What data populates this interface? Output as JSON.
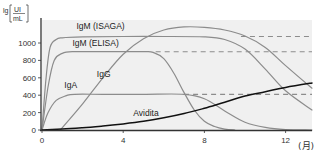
{
  "chart_data": {
    "type": "line",
    "title": "",
    "xlabel": "(月)",
    "ylabel": "lg [UI/mL]",
    "ylabel_parts": {
      "prefix": "lg",
      "numerator": "UI",
      "denominator": "mL"
    },
    "xlim": [
      0,
      13.3
    ],
    "ylim": [
      0,
      1250
    ],
    "x_ticks": [
      0,
      4,
      8,
      12
    ],
    "x_tick_labels": [
      "0",
      "4",
      "8",
      "12"
    ],
    "y_ticks": [
      0,
      200,
      400,
      600,
      800,
      1000
    ],
    "y_tick_labels": [
      "0",
      "200",
      "400",
      "600",
      "800",
      "1000"
    ],
    "grid": false,
    "legend": "inline labels",
    "series": [
      {
        "name": "IgM (ISAGA)",
        "color": "#8c8c8c",
        "x": [
          0,
          0.2,
          0.4,
          0.7,
          1.0,
          2,
          4,
          6,
          8,
          9,
          10,
          11,
          12,
          13.3
        ],
        "values": [
          0,
          600,
          950,
          1040,
          1060,
          1070,
          1075,
          1075,
          1070,
          1040,
          930,
          700,
          450,
          230
        ],
        "plateau_dashed": {
          "from": 9.8,
          "to": 13.3,
          "value": 1075
        }
      },
      {
        "name": "IgM (ELISA)",
        "color": "#8c8c8c",
        "x": [
          0,
          0.3,
          0.6,
          1.0,
          1.5,
          3,
          5,
          5.5,
          6,
          6.5,
          7,
          7.5,
          8,
          8.5,
          9,
          9.5
        ],
        "values": [
          0,
          500,
          800,
          880,
          900,
          900,
          900,
          890,
          820,
          650,
          430,
          230,
          100,
          40,
          10,
          0
        ],
        "plateau_dashed": {
          "from": 5.6,
          "to": 13.3,
          "value": 900
        }
      },
      {
        "name": "IgG",
        "color": "#8c8c8c",
        "x": [
          0.9,
          2,
          3,
          4,
          5,
          6,
          7,
          8,
          9,
          10,
          11,
          12,
          13.3
        ],
        "values": [
          0,
          300,
          600,
          870,
          1050,
          1150,
          1185,
          1180,
          1150,
          1080,
          950,
          740,
          480
        ]
      },
      {
        "name": "IgA",
        "color": "#8c8c8c",
        "x": [
          0,
          0.3,
          0.7,
          1.2,
          1.6,
          3,
          5,
          7,
          8,
          9,
          10,
          11,
          12,
          13.3
        ],
        "values": [
          0,
          200,
          340,
          395,
          410,
          410,
          410,
          410,
          360,
          220,
          90,
          30,
          5,
          0
        ],
        "plateau_dashed": {
          "from": 7,
          "to": 13.3,
          "value": 410
        }
      },
      {
        "name": "Avidita",
        "color": "#111111",
        "x": [
          0,
          1,
          2,
          3,
          4,
          5,
          6,
          7,
          8,
          9,
          10,
          11,
          12,
          13.3
        ],
        "values": [
          0,
          10,
          25,
          45,
          70,
          100,
          140,
          190,
          250,
          320,
          390,
          440,
          490,
          540
        ]
      }
    ],
    "annotations": [
      {
        "text": "IgM (ISAGA)",
        "x": 1.7,
        "y": 1160
      },
      {
        "text": "IgM (ELISA)",
        "x": 1.5,
        "y": 960
      },
      {
        "text": "IgG",
        "x": 2.7,
        "y": 610
      },
      {
        "text": "IgA",
        "x": 1.1,
        "y": 480
      },
      {
        "text": "Avidita",
        "x": 4.5,
        "y": 160
      }
    ],
    "background": "#f0f0f0"
  }
}
